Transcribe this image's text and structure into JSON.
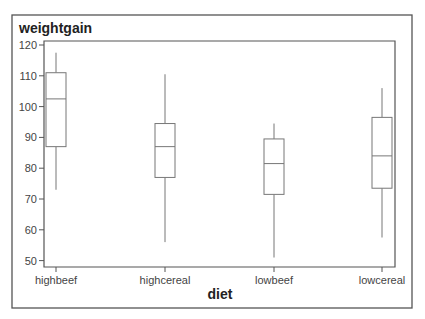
{
  "chart_data": {
    "type": "box",
    "title": "weightgain",
    "xlabel": "diet",
    "ylabel": "weightgain",
    "ylim": [
      49,
      121
    ],
    "yticks": [
      50,
      60,
      70,
      80,
      90,
      100,
      110,
      120
    ],
    "grid": false,
    "legend": null,
    "categories": [
      "highbeef",
      "highcereal",
      "lowbeef",
      "lowcereal"
    ],
    "series": [
      {
        "name": "highbeef",
        "whisker_low": 73,
        "q1": 87,
        "median": 102.5,
        "q3": 111,
        "whisker_high": 117.5
      },
      {
        "name": "highcereal",
        "whisker_low": 56,
        "q1": 77,
        "median": 87,
        "q3": 94.5,
        "whisker_high": 110.5
      },
      {
        "name": "lowbeef",
        "whisker_low": 51,
        "q1": 71.5,
        "median": 81.5,
        "q3": 89.5,
        "whisker_high": 94.5
      },
      {
        "name": "lowcereal",
        "whisker_low": 57.5,
        "q1": 73.5,
        "median": 84,
        "q3": 96.5,
        "whisker_high": 106
      }
    ]
  },
  "layout": {
    "outer": {
      "x": 12,
      "y": 15,
      "w": 400,
      "h": 293
    },
    "plot": {
      "x": 44,
      "y": 41,
      "w": 351,
      "h": 226
    },
    "y_at_120": 45,
    "px_per_unit": 3.08,
    "category_x": [
      56,
      165,
      274,
      382
    ],
    "box_width": 20
  }
}
